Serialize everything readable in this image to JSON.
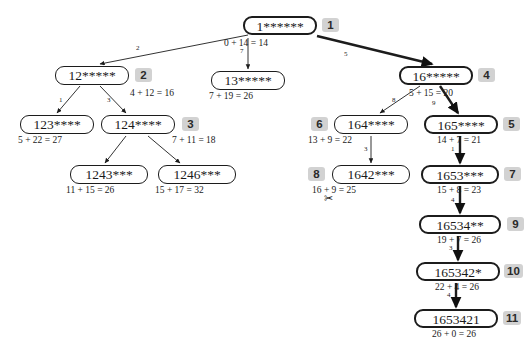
{
  "diagram": {
    "nodes": [
      {
        "id": "n1",
        "label": "1******",
        "cost": "0 + 14 = 14",
        "badge": "1",
        "x": 243,
        "y": 16,
        "w": 74,
        "bold": true,
        "badge_x": 322,
        "badge_y": 18,
        "cost_x": 224,
        "cost_y": 38
      },
      {
        "id": "n12",
        "label": "12*****",
        "cost": "4 + 12 = 16",
        "badge": "2",
        "x": 55,
        "y": 66,
        "w": 74,
        "bold": false,
        "badge_x": 135,
        "badge_y": 68,
        "cost_x": 130,
        "cost_y": 88
      },
      {
        "id": "n13",
        "label": "13*****",
        "cost": "7 + 19 = 26",
        "badge": "",
        "x": 211,
        "y": 71,
        "w": 74,
        "bold": false,
        "badge_x": 0,
        "badge_y": 0,
        "cost_x": 209,
        "cost_y": 91
      },
      {
        "id": "n16",
        "label": "16*****",
        "cost": "5 + 15 = 20",
        "badge": "4",
        "x": 399,
        "y": 66,
        "w": 74,
        "bold": true,
        "badge_x": 478,
        "badge_y": 68,
        "cost_x": 409,
        "cost_y": 88
      },
      {
        "id": "n123",
        "label": "123****",
        "cost": "5 + 22 = 27",
        "badge": "",
        "x": 20,
        "y": 115,
        "w": 74,
        "bold": false,
        "badge_x": 0,
        "badge_y": 0,
        "cost_x": 18,
        "cost_y": 135
      },
      {
        "id": "n124",
        "label": "124****",
        "cost": "7 + 11 = 18",
        "badge": "3",
        "x": 101,
        "y": 115,
        "w": 74,
        "bold": false,
        "badge_x": 182,
        "badge_y": 117,
        "cost_x": 172,
        "cost_y": 135
      },
      {
        "id": "n1243",
        "label": "1243***",
        "cost": "11 + 15 = 26",
        "badge": "",
        "x": 70,
        "y": 165,
        "w": 78,
        "bold": false,
        "badge_x": 0,
        "badge_y": 0,
        "cost_x": 66,
        "cost_y": 185
      },
      {
        "id": "n1246",
        "label": "1246***",
        "cost": "15 + 17 = 32",
        "badge": "",
        "x": 158,
        "y": 165,
        "w": 78,
        "bold": false,
        "badge_x": 0,
        "badge_y": 0,
        "cost_x": 155,
        "cost_y": 185
      },
      {
        "id": "n164",
        "label": "164****",
        "cost": "13 + 9 = 22",
        "badge": "6",
        "x": 334,
        "y": 115,
        "w": 74,
        "bold": false,
        "badge_x": 311,
        "badge_y": 117,
        "cost_x": 308,
        "cost_y": 135
      },
      {
        "id": "n165",
        "label": "165****",
        "cost": "14 + 7 = 21",
        "badge": "5",
        "x": 424,
        "y": 115,
        "w": 74,
        "bold": true,
        "badge_x": 503,
        "badge_y": 117,
        "cost_x": 437,
        "cost_y": 135
      },
      {
        "id": "n1642",
        "label": "1642***",
        "cost": "16 + 9 = 25",
        "badge": "8",
        "x": 332,
        "y": 165,
        "w": 78,
        "bold": false,
        "badge_x": 308,
        "badge_y": 167,
        "cost_x": 312,
        "cost_y": 185
      },
      {
        "id": "n1653",
        "label": "1653***",
        "cost": "15 + 8 = 23",
        "badge": "7",
        "x": 421,
        "y": 165,
        "w": 78,
        "bold": true,
        "badge_x": 504,
        "badge_y": 167,
        "cost_x": 437,
        "cost_y": 185
      },
      {
        "id": "n16534",
        "label": "16534**",
        "cost": "19 + 7 = 26",
        "badge": "9",
        "x": 419,
        "y": 215,
        "w": 82,
        "bold": true,
        "badge_x": 507,
        "badge_y": 217,
        "cost_x": 437,
        "cost_y": 235
      },
      {
        "id": "n165342",
        "label": "165342*",
        "cost": "22 + 4 = 26",
        "badge": "10",
        "x": 416,
        "y": 262,
        "w": 84,
        "bold": true,
        "badge_x": 504,
        "badge_y": 264,
        "cost_x": 435,
        "cost_y": 282
      },
      {
        "id": "n1653421",
        "label": "1653421",
        "cost": "26 + 0 = 26",
        "badge": "11",
        "x": 414,
        "y": 309,
        "w": 84,
        "bold": true,
        "badge_x": 503,
        "badge_y": 311,
        "cost_x": 432,
        "cost_y": 329
      }
    ],
    "edges": [
      {
        "from": "n1",
        "to": "n12",
        "label": "2",
        "bold": false,
        "x1": 248,
        "y1": 35,
        "x2": 100,
        "y2": 64,
        "lx": 136,
        "ly": 44
      },
      {
        "from": "n1",
        "to": "n13",
        "label": "7",
        "bold": false,
        "x1": 248,
        "y1": 38,
        "x2": 248,
        "y2": 69,
        "lx": 240,
        "ly": 47
      },
      {
        "from": "n1",
        "to": "n16",
        "label": "5",
        "bold": true,
        "x1": 317,
        "y1": 36,
        "x2": 432,
        "y2": 64,
        "lx": 344,
        "ly": 50
      },
      {
        "from": "n12",
        "to": "n123",
        "label": "1",
        "bold": false,
        "x1": 80,
        "y1": 86,
        "x2": 57,
        "y2": 113,
        "lx": 59,
        "ly": 96
      },
      {
        "from": "n12",
        "to": "n124",
        "label": "3",
        "bold": false,
        "x1": 100,
        "y1": 86,
        "x2": 126,
        "y2": 113,
        "lx": 107,
        "ly": 96
      },
      {
        "from": "n124",
        "to": "n1243",
        "label": "",
        "bold": false,
        "x1": 126,
        "y1": 136,
        "x2": 105,
        "y2": 163,
        "lx": 0,
        "ly": 0
      },
      {
        "from": "n124",
        "to": "n1246",
        "label": "",
        "bold": false,
        "x1": 148,
        "y1": 136,
        "x2": 180,
        "y2": 163,
        "lx": 0,
        "ly": 0
      },
      {
        "from": "n16",
        "to": "n164",
        "label": "8",
        "bold": false,
        "x1": 420,
        "y1": 86,
        "x2": 380,
        "y2": 113,
        "lx": 392,
        "ly": 96
      },
      {
        "from": "n16",
        "to": "n165",
        "label": "9",
        "bold": true,
        "x1": 440,
        "y1": 86,
        "x2": 458,
        "y2": 113,
        "lx": 432,
        "ly": 99
      },
      {
        "from": "n164",
        "to": "n1642",
        "label": "3",
        "bold": false,
        "x1": 371,
        "y1": 136,
        "x2": 371,
        "y2": 163,
        "lx": 364,
        "ly": 145
      },
      {
        "from": "n165",
        "to": "n1653",
        "label": "1",
        "bold": true,
        "x1": 460,
        "y1": 136,
        "x2": 460,
        "y2": 163,
        "lx": 451,
        "ly": 145
      },
      {
        "from": "n1653",
        "to": "n16534",
        "label": "4",
        "bold": true,
        "x1": 460,
        "y1": 186,
        "x2": 460,
        "y2": 213,
        "lx": 451,
        "ly": 196
      },
      {
        "from": "n16534",
        "to": "n165342",
        "label": "3",
        "bold": true,
        "x1": 458,
        "y1": 236,
        "x2": 458,
        "y2": 260,
        "lx": 449,
        "ly": 244
      },
      {
        "from": "n165342",
        "to": "n1653421",
        "label": "4",
        "bold": true,
        "x1": 456,
        "y1": 283,
        "x2": 456,
        "y2": 307,
        "lx": 447,
        "ly": 291
      }
    ],
    "annotations": [
      {
        "name": "scissors-icon",
        "glyph": "✂",
        "x": 324,
        "y": 192
      }
    ],
    "colors": {
      "badge_bg": "#d2d2d2",
      "node_border": "#1c1c1c",
      "background": "#ffffff",
      "text": "#1a1a1a"
    }
  }
}
